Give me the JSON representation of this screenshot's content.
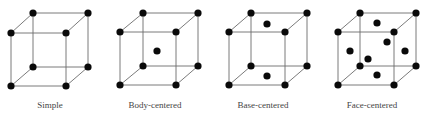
{
  "colors": {
    "background": "#ffffff",
    "edge": "#6b6b6b",
    "atom": "#0a0a0a",
    "label": "#444444"
  },
  "atom_radius": 3.6,
  "lattices": [
    {
      "id": "simple",
      "label": "Simple",
      "label_x": 50,
      "corners": {
        "ftl": [
          11,
          33
        ],
        "ftr": [
          66,
          33
        ],
        "fbl": [
          11,
          86
        ],
        "fbr": [
          66,
          86
        ],
        "btl": [
          33,
          13
        ],
        "btr": [
          88,
          13
        ],
        "bbl": [
          33,
          67
        ],
        "bbr": [
          88,
          67
        ]
      },
      "extra_atoms": []
    },
    {
      "id": "body-centered",
      "label": "Body-centered",
      "label_x": 155,
      "corners": {
        "ftl": [
          120,
          32
        ],
        "ftr": [
          176,
          32
        ],
        "fbl": [
          120,
          85
        ],
        "fbr": [
          176,
          85
        ],
        "btl": [
          143,
          13
        ],
        "btr": [
          198,
          13
        ],
        "bbl": [
          143,
          66
        ],
        "bbr": [
          198,
          66
        ]
      },
      "extra_atoms": [
        [
          157,
          51
        ]
      ]
    },
    {
      "id": "base-centered",
      "label": "Base-centered",
      "label_x": 263,
      "corners": {
        "ftl": [
          229,
          32
        ],
        "ftr": [
          285,
          32
        ],
        "fbl": [
          229,
          85
        ],
        "fbr": [
          285,
          85
        ],
        "btl": [
          251,
          13
        ],
        "btr": [
          307,
          13
        ],
        "bbl": [
          251,
          66
        ],
        "bbr": [
          307,
          66
        ]
      },
      "extra_atoms": [
        [
          267,
          24
        ],
        [
          267,
          76
        ]
      ]
    },
    {
      "id": "face-centered",
      "label": "Face-centered",
      "label_x": 372,
      "corners": {
        "ftl": [
          338,
          32
        ],
        "ftr": [
          394,
          32
        ],
        "fbl": [
          338,
          85
        ],
        "fbr": [
          394,
          85
        ],
        "btl": [
          360,
          13
        ],
        "btr": [
          416,
          13
        ],
        "bbl": [
          360,
          66
        ],
        "bbr": [
          416,
          66
        ]
      },
      "extra_atoms": [
        [
          377,
          23
        ],
        [
          387,
          42
        ],
        [
          350,
          51
        ],
        [
          405,
          51
        ],
        [
          368,
          59
        ],
        [
          377,
          75
        ]
      ]
    }
  ]
}
